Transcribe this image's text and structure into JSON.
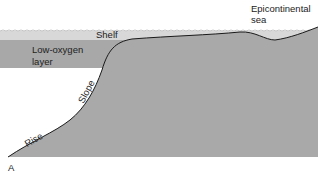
{
  "diagram": {
    "panel_label": "A",
    "labels": {
      "shelf": "Shelf",
      "low_oxygen_line1": "Low-oxygen",
      "low_oxygen_line2": "layer",
      "slope": "Slope",
      "rise": "Rise",
      "epicontinental_line1": "Epicontinental",
      "epicontinental_line2": "sea"
    },
    "colors": {
      "sea_surface": "#d8d8d8",
      "low_oxygen_layer": "#a8a8a8",
      "continent": "#a9a9a9",
      "outline": "#1a1a1a",
      "background": "#ffffff"
    }
  }
}
